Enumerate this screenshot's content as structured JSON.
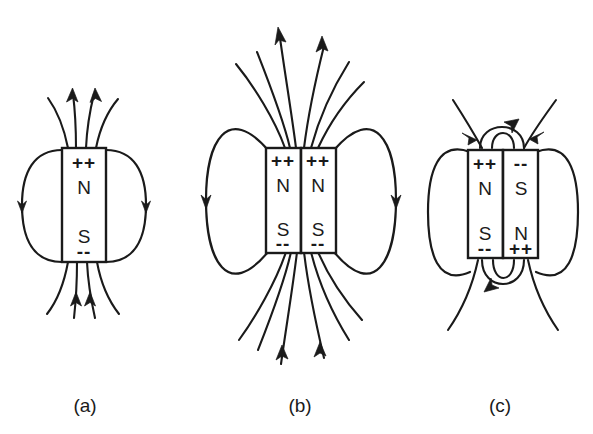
{
  "figure": {
    "background_color": "#ffffff",
    "ink_color": "#1a1a1a",
    "width": 593,
    "height": 434
  },
  "panels": [
    {
      "id": "a",
      "caption": "(a)",
      "caption_x": 85,
      "caption_y": 412,
      "description": "single bar magnet with dipole field",
      "magnets": [
        {
          "id": "a-magnet-1",
          "x": 62,
          "y": 148,
          "width": 44,
          "height": 114,
          "top_charge": "++",
          "top_pole": "N",
          "bottom_pole": "S",
          "bottom_charge": "--"
        }
      ]
    },
    {
      "id": "b",
      "caption": "(b)",
      "caption_x": 300,
      "caption_y": 412,
      "description": "two parallel bar magnets, like poles aligned, fields reinforce",
      "magnets": [
        {
          "id": "b-magnet-1",
          "x": 266,
          "y": 148,
          "width": 35,
          "height": 105,
          "top_charge": "++",
          "top_pole": "N",
          "bottom_pole": "S",
          "bottom_charge": "--"
        },
        {
          "id": "b-magnet-2",
          "x": 301,
          "y": 148,
          "width": 35,
          "height": 105,
          "top_charge": "++",
          "top_pole": "N",
          "bottom_pole": "S",
          "bottom_charge": "--"
        }
      ]
    },
    {
      "id": "c",
      "caption": "(c)",
      "caption_x": 500,
      "caption_y": 412,
      "description": "two antiparallel bar magnets, opposite poles adjacent, flux closes between them",
      "magnets": [
        {
          "id": "c-magnet-1",
          "x": 468,
          "y": 150,
          "width": 35,
          "height": 108,
          "top_charge": "++",
          "top_pole": "N",
          "bottom_pole": "S",
          "bottom_charge": "--"
        },
        {
          "id": "c-magnet-2",
          "x": 503,
          "y": 150,
          "width": 35,
          "height": 108,
          "top_charge": "--",
          "top_pole": "S",
          "bottom_pole": "N",
          "bottom_charge": "++"
        }
      ]
    }
  ]
}
